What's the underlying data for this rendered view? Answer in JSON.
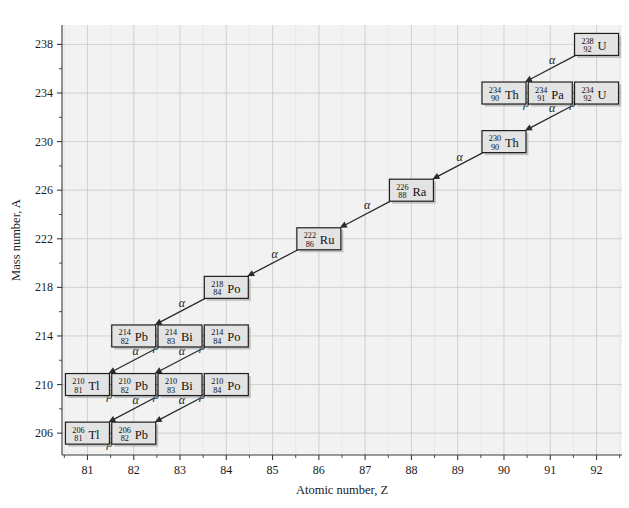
{
  "chart_data": {
    "type": "scatter",
    "title": "",
    "xlabel": "Atomic number, Z",
    "ylabel": "Mass number, A",
    "xlim": [
      80.45,
      92.55
    ],
    "ylim": [
      204.2,
      239.6
    ],
    "xticks": [
      81,
      82,
      83,
      84,
      85,
      86,
      87,
      88,
      89,
      90,
      91,
      92
    ],
    "yticks": [
      206,
      210,
      214,
      218,
      222,
      226,
      230,
      234,
      238
    ],
    "x_minor_step": 0.5,
    "y_minor_step": 2,
    "grid": true,
    "grid_color": "#c8c8c8",
    "plot_background": "#f2f2f2",
    "legend": "none",
    "nuclides": [
      {
        "id": "U238",
        "A": 238,
        "Z": 92,
        "symbol": "U",
        "label": "238 92 U"
      },
      {
        "id": "Th234",
        "A": 234,
        "Z": 90,
        "symbol": "Th",
        "label": "234 90 Th"
      },
      {
        "id": "Pa234",
        "A": 234,
        "Z": 91,
        "symbol": "Pa",
        "label": "234 91 Pa"
      },
      {
        "id": "U234",
        "A": 234,
        "Z": 92,
        "symbol": "U",
        "label": "234 92 U"
      },
      {
        "id": "Th230",
        "A": 230,
        "Z": 90,
        "symbol": "Th",
        "label": "230 90 Th"
      },
      {
        "id": "Ra226",
        "A": 226,
        "Z": 88,
        "symbol": "Ra",
        "label": "226 88 Ra"
      },
      {
        "id": "Ru222",
        "A": 222,
        "Z": 86,
        "symbol": "Ru",
        "label": "222 86 Ru"
      },
      {
        "id": "Po218",
        "A": 218,
        "Z": 84,
        "symbol": "Po",
        "label": "218 84 Po"
      },
      {
        "id": "Pb214",
        "A": 214,
        "Z": 82,
        "symbol": "Pb",
        "label": "214 82 Pb"
      },
      {
        "id": "Bi214",
        "A": 214,
        "Z": 83,
        "symbol": "Bi",
        "label": "214 83 Bi"
      },
      {
        "id": "Po214",
        "A": 214,
        "Z": 84,
        "symbol": "Po",
        "label": "214 84 Po"
      },
      {
        "id": "Tl210",
        "A": 210,
        "Z": 81,
        "symbol": "Tl",
        "label": "210 81 Tl"
      },
      {
        "id": "Pb210",
        "A": 210,
        "Z": 82,
        "symbol": "Pb",
        "label": "210 82 Pb"
      },
      {
        "id": "Bi210",
        "A": 210,
        "Z": 83,
        "symbol": "Bi",
        "label": "210 83 Bi"
      },
      {
        "id": "Po210",
        "A": 210,
        "Z": 84,
        "symbol": "Po",
        "label": "210 84 Po"
      },
      {
        "id": "Tl206",
        "A": 206,
        "Z": 81,
        "symbol": "Tl",
        "label": "206 81 Tl"
      },
      {
        "id": "Pb206",
        "A": 206,
        "Z": 82,
        "symbol": "Pb",
        "label": "206 82 Pb"
      }
    ],
    "decays": [
      {
        "from": "U238",
        "to": "Th234",
        "mode": "alpha",
        "label": "α"
      },
      {
        "from": "Th234",
        "to": "Pa234",
        "mode": "beta",
        "label": "β"
      },
      {
        "from": "Pa234",
        "to": "U234",
        "mode": "beta",
        "label": "β"
      },
      {
        "from": "U234",
        "to": "Th230",
        "mode": "alpha",
        "label": "α"
      },
      {
        "from": "Th230",
        "to": "Ra226",
        "mode": "alpha",
        "label": "α"
      },
      {
        "from": "Ra226",
        "to": "Ru222",
        "mode": "alpha",
        "label": "α"
      },
      {
        "from": "Ru222",
        "to": "Po218",
        "mode": "alpha",
        "label": "α"
      },
      {
        "from": "Po218",
        "to": "Pb214",
        "mode": "alpha",
        "label": "α"
      },
      {
        "from": "Pb214",
        "to": "Bi214",
        "mode": "beta",
        "label": "β"
      },
      {
        "from": "Bi214",
        "to": "Po214",
        "mode": "beta",
        "label": "β"
      },
      {
        "from": "Bi214",
        "to": "Tl210",
        "mode": "alpha",
        "label": "α"
      },
      {
        "from": "Po214",
        "to": "Pb210",
        "mode": "alpha",
        "label": "α"
      },
      {
        "from": "Tl210",
        "to": "Pb210",
        "mode": "beta",
        "label": "β"
      },
      {
        "from": "Pb210",
        "to": "Bi210",
        "mode": "beta",
        "label": "β"
      },
      {
        "from": "Bi210",
        "to": "Po210",
        "mode": "beta",
        "label": "β"
      },
      {
        "from": "Bi210",
        "to": "Tl206",
        "mode": "alpha",
        "label": "α"
      },
      {
        "from": "Po210",
        "to": "Pb206",
        "mode": "alpha",
        "label": "α"
      },
      {
        "from": "Tl206",
        "to": "Pb206",
        "mode": "beta",
        "label": "β"
      }
    ]
  }
}
